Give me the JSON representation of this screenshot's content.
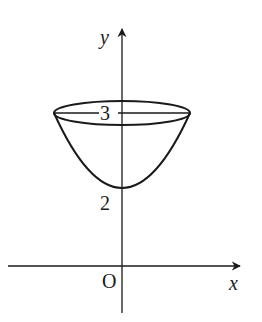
{
  "figure": {
    "type": "coordinate-diagram",
    "axes": {
      "x_label": "x",
      "y_label": "y",
      "origin_label": "O"
    },
    "tick_labels": {
      "rim_level": "3",
      "vertex_level": "2"
    },
    "colors": {
      "stroke": "#1a1a1a",
      "background": "#ffffff"
    }
  }
}
